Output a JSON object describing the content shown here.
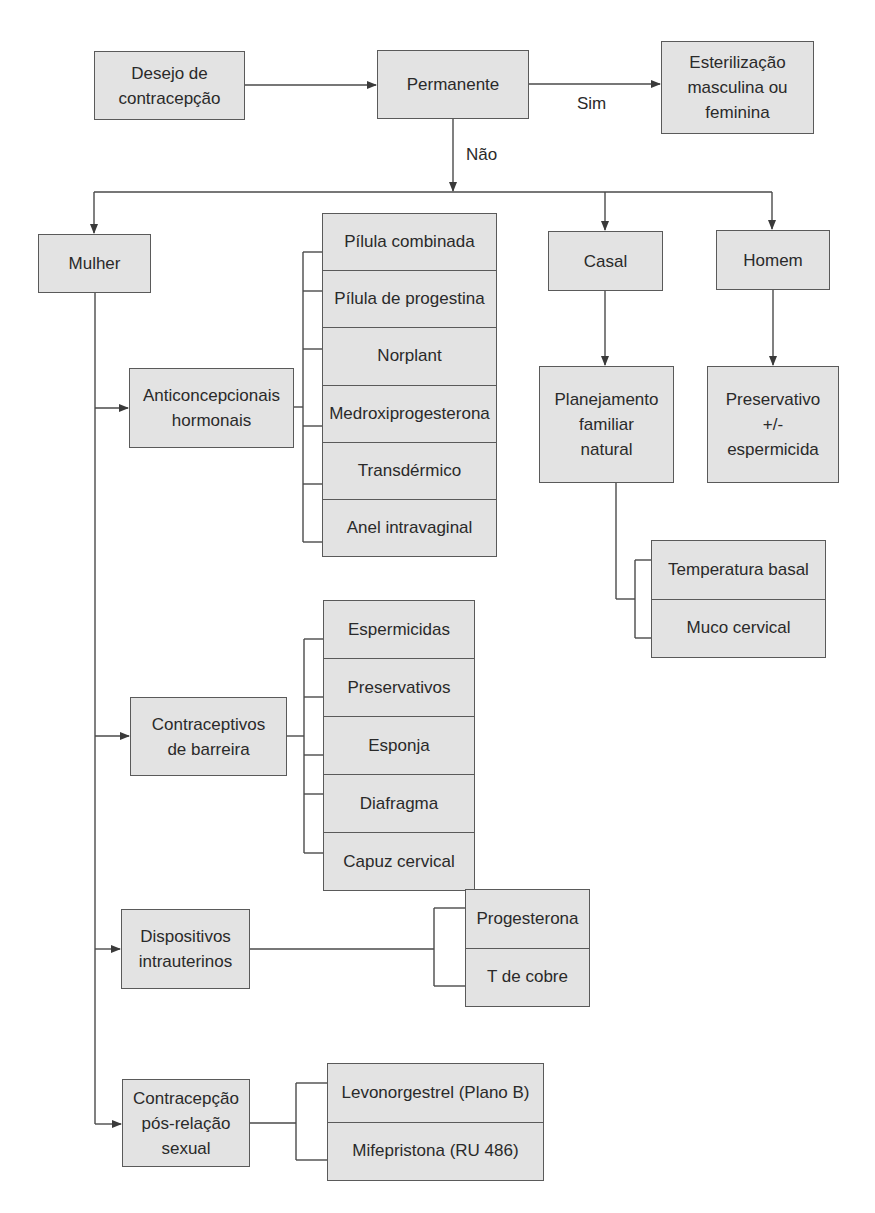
{
  "colors": {
    "box_fill": "#e3e3e3",
    "box_border": "#5a5a5a",
    "line": "#4a4a4a",
    "text": "#2a2a2a",
    "background": "#ffffff"
  },
  "nodes": {
    "desejo": "Desejo de\ncontracepção",
    "permanente": "Permanente",
    "esterilizacao": "Esterilização\nmasculina ou\nfeminina",
    "mulher": "Mulher",
    "casal": "Casal",
    "homem": "Homem",
    "hormonais": "Anticoncepcionais\nhormonais",
    "barreira": "Contraceptivos\nde barreira",
    "diu": "Dispositivos\nintrauterinos",
    "pos_relacao": "Contracepção\npós-relação\nsexual",
    "planejamento": "Planejamento\nfamiliar\nnatural",
    "preservativo_homem": "Preservativo\n+/-\nespermicida"
  },
  "edge_labels": {
    "sim": "Sim",
    "nao": "Não"
  },
  "lists": {
    "hormonais": [
      "Pílula combinada",
      "Pílula de progestina",
      "Norplant",
      "Medroxiprogesterona",
      "Transdérmico",
      "Anel intravaginal"
    ],
    "barreira": [
      "Espermicidas",
      "Preservativos",
      "Esponja",
      "Diafragma",
      "Capuz cervical"
    ],
    "diu": [
      "Progesterona",
      "T de cobre"
    ],
    "pos_relacao": [
      "Levonorgestrel (Plano B)",
      "Mifepristona (RU 486)"
    ],
    "planejamento": [
      "Temperatura basal",
      "Muco cervical"
    ]
  }
}
